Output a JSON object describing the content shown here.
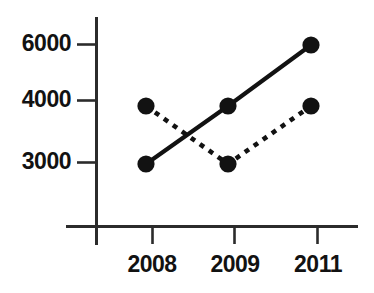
{
  "chart_data": {
    "type": "line",
    "title": "",
    "subtitle": "",
    "xlabel": "",
    "ylabel": "",
    "categories": [
      "2008",
      "2009",
      "2011"
    ],
    "x_tick_labels": [
      "2008",
      "2009",
      "2011"
    ],
    "y_tick_labels": [
      "3000",
      "4000",
      "6000"
    ],
    "y_ticks": [
      3000,
      4000,
      6000
    ],
    "ylim": [
      3000,
      6000
    ],
    "y_axis_scale": "broken-nonlinear",
    "grid": false,
    "legend": "none",
    "marker": "filled-circle",
    "series": [
      {
        "name": "series-solid",
        "linestyle": "solid",
        "color": "#121212",
        "values": [
          3000,
          4000,
          6000
        ]
      },
      {
        "name": "series-dashed",
        "linestyle": "dashed",
        "color": "#121212",
        "values": [
          4000,
          3000,
          4000
        ]
      }
    ],
    "annotations": []
  },
  "axis": {
    "y_labels": [
      {
        "text": "6000",
        "value": 6000
      },
      {
        "text": "4000",
        "value": 4000
      },
      {
        "text": "3000",
        "value": 3000
      }
    ],
    "x_labels": [
      {
        "text": "2008",
        "value": "2008"
      },
      {
        "text": "2009",
        "value": "2009"
      },
      {
        "text": "2011",
        "value": "2011"
      }
    ]
  },
  "colors": {
    "background": "#ffffff",
    "ink": "#121212",
    "axis": "#2b2b2b"
  }
}
